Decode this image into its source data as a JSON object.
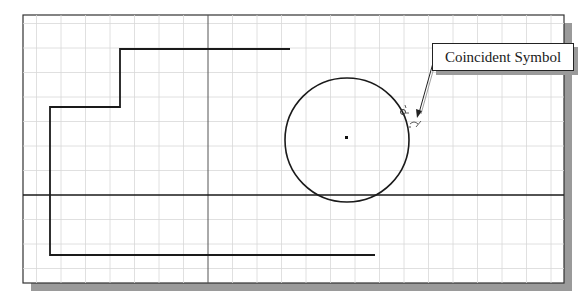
{
  "figure": {
    "callout_label": "Coincident Symbol"
  },
  "colors": {
    "background": "#ffffff",
    "grid_line": "#d8d8d8",
    "geometry": "#1a1a1a",
    "axis": "#555555",
    "shadow": "#9a9a9a"
  },
  "icons": {
    "coincident_constraint": "coincident-symbol-icon",
    "callout_arrow": "arrow-icon",
    "circle_center": "center-point-icon"
  }
}
